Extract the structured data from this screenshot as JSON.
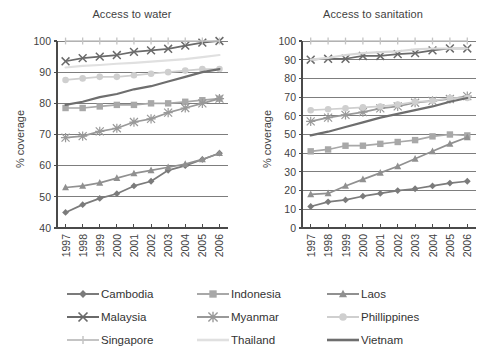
{
  "chart_data": [
    {
      "type": "line",
      "title": "Access to water",
      "xlabel": "",
      "ylabel": "% coverage",
      "x": [
        "1997",
        "1998",
        "1999",
        "2000",
        "2001",
        "2002",
        "2003",
        "2004",
        "2005",
        "2006"
      ],
      "ylim": [
        40,
        100
      ],
      "yticks": [
        40,
        50,
        60,
        70,
        80,
        90,
        100
      ],
      "grid": "horizontal",
      "legend": "bottom",
      "series": [
        {
          "name": "Cambodia",
          "marker": "diamond",
          "color": "#7b7b7b",
          "values": [
            45.0,
            47.5,
            49.5,
            51.0,
            53.5,
            55.0,
            58.5,
            60.0,
            62.0,
            64.0
          ]
        },
        {
          "name": "Indonesia",
          "marker": "square",
          "color": "#a8a8a8",
          "values": [
            78.5,
            78.5,
            79.0,
            79.5,
            79.5,
            80.0,
            80.0,
            80.5,
            81.0,
            81.5
          ]
        },
        {
          "name": "Laos",
          "marker": "triangle",
          "color": "#909090",
          "values": [
            53.0,
            53.5,
            54.5,
            56.0,
            57.5,
            58.5,
            59.5,
            60.5,
            62.0,
            64.0
          ]
        },
        {
          "name": "Malaysia",
          "marker": "cross",
          "color": "#6a6a6a",
          "values": [
            93.5,
            94.5,
            95.0,
            95.5,
            96.5,
            97.0,
            97.5,
            98.5,
            99.5,
            100.0
          ]
        },
        {
          "name": "Myanmar",
          "marker": "star",
          "color": "#999999",
          "values": [
            69.0,
            69.5,
            71.0,
            72.0,
            74.0,
            75.0,
            77.0,
            78.5,
            80.0,
            81.5
          ]
        },
        {
          "name": "Phillippines",
          "marker": "circle",
          "color": "#cfcfcf",
          "values": [
            87.5,
            88.0,
            88.5,
            88.5,
            89.0,
            89.5,
            90.0,
            90.5,
            91.0,
            91.0
          ]
        },
        {
          "name": "Singapore",
          "marker": "tick",
          "color": "#c4c4c4",
          "values": [
            100,
            100,
            100,
            100,
            100,
            100,
            100,
            100,
            100,
            100
          ]
        },
        {
          "name": "Thailand",
          "marker": "none",
          "color": "#e0e0e0",
          "values": [
            91.5,
            92.0,
            92.3,
            92.7,
            93.0,
            93.4,
            93.8,
            94.2,
            94.8,
            95.5
          ]
        },
        {
          "name": "Vietnam",
          "marker": "none",
          "color": "#6e6e6e",
          "values": [
            79.5,
            80.5,
            82.0,
            83.0,
            84.5,
            85.5,
            87.0,
            88.5,
            90.0,
            91.0
          ]
        }
      ]
    },
    {
      "type": "line",
      "title": "Access to sanitation",
      "xlabel": "",
      "ylabel": "% coverage",
      "x": [
        "1997",
        "1998",
        "1999",
        "2000",
        "2001",
        "2002",
        "2003",
        "2004",
        "2005",
        "2006"
      ],
      "ylim": [
        0,
        100
      ],
      "yticks": [
        0,
        10,
        20,
        30,
        40,
        50,
        60,
        70,
        80,
        90,
        100
      ],
      "grid": "horizontal",
      "legend": "bottom",
      "series": [
        {
          "name": "Cambodia",
          "marker": "diamond",
          "color": "#7b7b7b",
          "values": [
            11.5,
            14.0,
            15.0,
            17.0,
            18.5,
            20.0,
            21.0,
            22.5,
            24.0,
            25.0
          ]
        },
        {
          "name": "Indonesia",
          "marker": "square",
          "color": "#a8a8a8",
          "values": [
            41.0,
            42.0,
            44.0,
            44.0,
            45.0,
            46.0,
            47.0,
            49.0,
            50.0,
            49.5
          ]
        },
        {
          "name": "Laos",
          "marker": "triangle",
          "color": "#909090",
          "values": [
            18.0,
            18.5,
            22.5,
            26.0,
            29.5,
            33.0,
            37.0,
            41.0,
            45.0,
            48.5
          ]
        },
        {
          "name": "Malaysia",
          "marker": "cross",
          "color": "#6a6a6a",
          "values": [
            90.0,
            90.5,
            90.5,
            92.0,
            92.0,
            93.0,
            93.5,
            95.0,
            96.0,
            96.0
          ]
        },
        {
          "name": "Myanmar",
          "marker": "star",
          "color": "#999999",
          "values": [
            57.0,
            59.0,
            60.5,
            62.0,
            64.0,
            65.0,
            67.0,
            68.0,
            69.0,
            70.5
          ]
        },
        {
          "name": "Phillippines",
          "marker": "circle",
          "color": "#cfcfcf",
          "values": [
            63.0,
            63.5,
            64.0,
            64.5,
            65.0,
            66.0,
            67.5,
            68.0,
            69.5,
            69.5
          ]
        },
        {
          "name": "Singapore",
          "marker": "tick",
          "color": "#c4c4c4",
          "values": [
            100,
            100,
            100,
            100,
            100,
            100,
            100,
            100,
            100,
            100
          ]
        },
        {
          "name": "Thailand",
          "marker": "none",
          "color": "#d8d8d8",
          "values": [
            90.0,
            91.0,
            92.5,
            93.5,
            94.0,
            94.5,
            95.5,
            96.0,
            96.0,
            96.0
          ]
        },
        {
          "name": "Vietnam",
          "marker": "none",
          "color": "#6e6e6e",
          "values": [
            49.5,
            51.5,
            54.0,
            56.5,
            59.0,
            61.0,
            63.0,
            65.0,
            67.5,
            69.5
          ]
        }
      ]
    }
  ],
  "legend": {
    "rows": [
      [
        {
          "label": "Cambodia",
          "marker": "diamond",
          "color": "#7b7b7b"
        },
        {
          "label": "Indonesia",
          "marker": "square",
          "color": "#a8a8a8"
        },
        {
          "label": "Laos",
          "marker": "triangle",
          "color": "#909090"
        }
      ],
      [
        {
          "label": "Malaysia",
          "marker": "cross",
          "color": "#6a6a6a"
        },
        {
          "label": "Myanmar",
          "marker": "star",
          "color": "#999999"
        },
        {
          "label": "Phillippines",
          "marker": "circle",
          "color": "#cfcfcf"
        }
      ],
      [
        {
          "label": "Singapore",
          "marker": "tick",
          "color": "#c4c4c4"
        },
        {
          "label": "Thailand",
          "marker": "none",
          "color": "#e0e0e0"
        },
        {
          "label": "Vietnam",
          "marker": "none",
          "color": "#6e6e6e"
        }
      ]
    ]
  },
  "colors": {
    "axis": "#4a4a4a",
    "grid": "#6f6f6f",
    "text": "#3f3f3f",
    "background": "#ffffff"
  }
}
